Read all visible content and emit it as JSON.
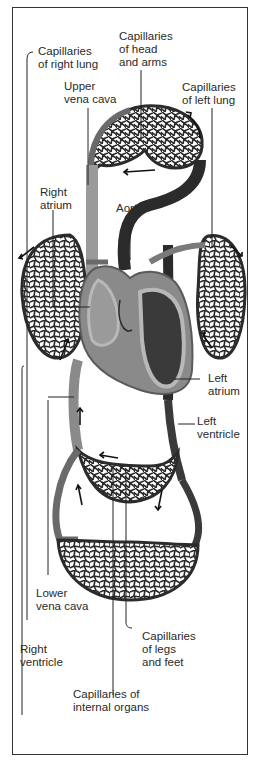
{
  "figure": {
    "type": "circulatory-system-diagram",
    "colors": {
      "vessel_dark": "#2b2b2b",
      "vessel_mid": "#6a6a6a",
      "vessel_light": "#9a9a9a",
      "heart_wall": "#b8b8b8",
      "frame": "#333333",
      "text": "#2a2a2a",
      "background": "#ffffff"
    },
    "labels": {
      "cap_right_lung": "Capillaries\nof right lung",
      "cap_head_arms": "Capillaries\nof head\nand arms",
      "upper_vena_cava": "Upper\nvena cava",
      "cap_left_lung": "Capillaries\nof left lung",
      "right_atrium": "Right\natrium",
      "aorta": "Aorta",
      "left_atrium": "Left\natrium",
      "left_ventricle": "Left\nventricle",
      "lower_vena_cava": "Lower\nvena cava",
      "right_ventricle": "Right\nventricle",
      "cap_legs_feet": "Capillaries\nof legs\nand feet",
      "cap_internal_organs": "Capillaries of\ninternal organs"
    }
  }
}
